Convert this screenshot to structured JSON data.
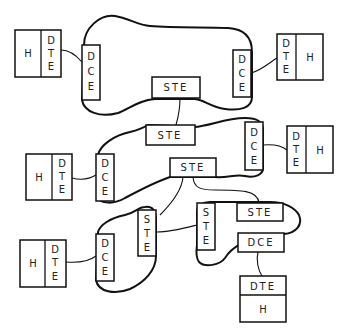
{
  "diagram": {
    "networks": [
      {
        "id": "net-1",
        "nodes": [
          "DCE-left",
          "DCE-right",
          "STE"
        ]
      },
      {
        "id": "net-2",
        "nodes": [
          "STE-top",
          "DCE-right",
          "DCE-left",
          "STE-mid"
        ]
      },
      {
        "id": "net-3",
        "nodes": [
          "STE",
          "DCE"
        ]
      },
      {
        "id": "net-4",
        "nodes": [
          "STE-vertical",
          "STE",
          "DCE"
        ]
      }
    ],
    "labels": {
      "h": "H",
      "dte_d": "D",
      "dte_t": "T",
      "dte_e": "E",
      "dce_d": "D",
      "dce_c": "C",
      "dce_e": "E",
      "ste_s": "S",
      "ste_t": "T",
      "ste_e": "E",
      "ste": "STE",
      "dce": "DCE",
      "dte": "DTE"
    }
  }
}
